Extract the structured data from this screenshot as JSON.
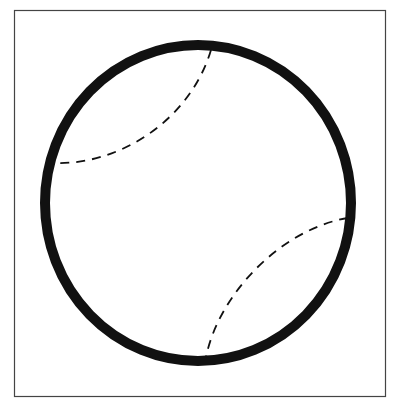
{
  "figure": {
    "frame": {
      "x": 14,
      "y": 10,
      "width": 372,
      "height": 386,
      "color": "#444444"
    },
    "ball": {
      "cx": 198,
      "cy": 203,
      "rx": 153,
      "ry": 158,
      "stroke": "#111111",
      "stroke_width": 10
    },
    "seams": [
      {
        "d": "M 211 50 C 190 120, 120 165, 55 163",
        "dash": "9 7"
      },
      {
        "d": "M 348 218 C 285 228, 220 290, 206 357",
        "dash": "9 7"
      }
    ]
  }
}
